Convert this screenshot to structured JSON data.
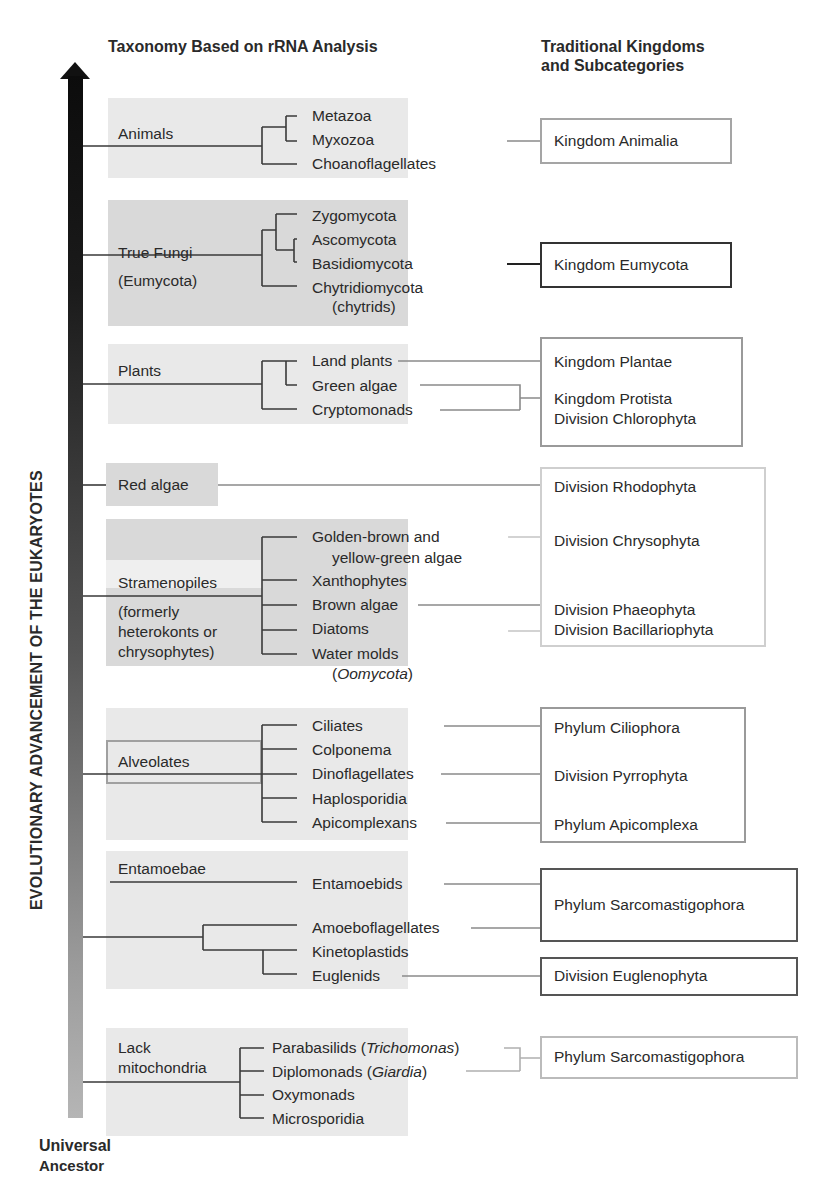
{
  "headers": {
    "left": "Taxonomy Based on rRNA Analysis",
    "right_line1": "Traditional Kingdoms",
    "right_line2": "and Subcategories"
  },
  "axis": {
    "label": "EVOLUTIONARY ADVANCEMENT OF THE EUKARYOTES",
    "bottom_line1": "Universal",
    "bottom_line2": "Ancestor"
  },
  "groups": [
    {
      "name": "Animals",
      "taxa": [
        "Metazoa",
        "Myxozoa",
        "Choanoflagellates"
      ]
    },
    {
      "name": "True Fungi",
      "name2": "(Eumycota)",
      "taxa": [
        "Zygomycota",
        "Ascomycota",
        "Basidiomycota",
        "Chytridiomycota",
        "(chytrids)"
      ]
    },
    {
      "name": "Plants",
      "taxa": [
        "Land plants",
        "Green algae",
        "Cryptomonads"
      ]
    },
    {
      "name": "Red algae",
      "taxa": []
    },
    {
      "name": "Stramenopiles",
      "note": [
        "(formerly",
        "heterokonts or",
        "chrysophytes)"
      ],
      "taxa": [
        "Golden-brown and",
        "yellow-green algae",
        "Xanthophytes",
        "Brown algae",
        "Diatoms",
        "Water molds",
        "Oomycota"
      ]
    },
    {
      "name": "Alveolates",
      "taxa": [
        "Ciliates",
        "Colponema",
        "Dinoflagellates",
        "Haplosporidia",
        "Apicomplexans"
      ]
    },
    {
      "name": "Entamoebae",
      "taxa": [
        "Entamoebids",
        "Amoeboflagellates",
        "Kinetoplastids",
        "Euglenids"
      ]
    },
    {
      "name": "Lack",
      "name2": "mitochondria",
      "taxa": [
        "Parabasilids (",
        "Trichomonas",
        ")",
        "Diplomonads (",
        "Giardia",
        ")",
        "Oxymonads",
        "Microsporidia"
      ]
    }
  ],
  "traditional": [
    {
      "label": "Kingdom Animalia"
    },
    {
      "label": "Kingdom Eumycota"
    },
    {
      "label": "Kingdom Plantae",
      "label2": "Kingdom Protista",
      "label3": "Division Chlorophyta"
    },
    {
      "label": "Division Rhodophyta",
      "label2": "Division Chrysophyta",
      "label3": "Division Phaeophyta",
      "label4": "Division Bacillariophyta"
    },
    {
      "label": "Phylum Ciliophora",
      "label2": "Division Pyrrophyta",
      "label3": "Phylum Apicomplexa"
    },
    {
      "label": "Phylum Sarcomastigophora"
    },
    {
      "label": "Division Euglenophyta"
    },
    {
      "label": "Phylum Sarcomastigophora"
    }
  ]
}
